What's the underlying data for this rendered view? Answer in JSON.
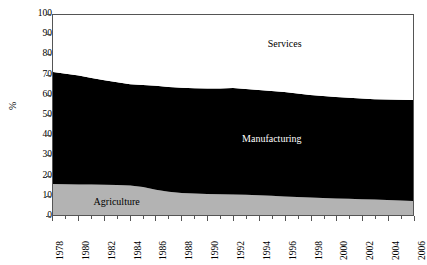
{
  "chart_data": {
    "type": "area",
    "stacked": true,
    "title": "",
    "subtitle": "",
    "xlabel": "",
    "ylabel": "%",
    "xlim": [
      1978,
      2006
    ],
    "ylim": [
      0,
      100
    ],
    "grid": false,
    "legend_position": "inline-labels",
    "y_ticks": [
      0,
      10,
      20,
      30,
      40,
      50,
      60,
      70,
      80,
      90,
      100
    ],
    "x_ticks_major": [
      1978,
      1980,
      1982,
      1984,
      1986,
      1988,
      1990,
      1992,
      1994,
      1996,
      1998,
      2000,
      2002,
      2004,
      2006
    ],
    "x_ticks_minor": [
      1979,
      1981,
      1983,
      1985,
      1987,
      1989,
      1991,
      1993,
      1995,
      1997,
      1999,
      2001,
      2003,
      2005
    ],
    "x": [
      1978,
      1979,
      1980,
      1981,
      1982,
      1983,
      1984,
      1985,
      1986,
      1987,
      1988,
      1989,
      1990,
      1991,
      1992,
      1993,
      1994,
      1995,
      1996,
      1997,
      1998,
      1999,
      2000,
      2001,
      2002,
      2003,
      2004,
      2005,
      2006
    ],
    "series": [
      {
        "name": "Agriculture",
        "color": "#b3b3b3",
        "label_color": "#000000",
        "values": [
          15.5,
          15.4,
          15.3,
          15.2,
          15.1,
          15.0,
          14.8,
          14.0,
          12.6,
          11.6,
          11.0,
          10.7,
          10.5,
          10.4,
          10.3,
          10.1,
          9.9,
          9.6,
          9.3,
          9.0,
          8.7,
          8.5,
          8.3,
          8.1,
          7.9,
          7.7,
          7.5,
          7.2,
          7.0
        ]
      },
      {
        "name": "Manufacturing",
        "color": "#000000",
        "label_color": "#ffffff",
        "values": [
          56.0,
          55.2,
          54.4,
          53.3,
          52.3,
          51.4,
          50.6,
          51.0,
          52.0,
          52.4,
          52.6,
          52.7,
          52.7,
          52.8,
          53.2,
          52.9,
          52.6,
          52.4,
          52.2,
          51.8,
          51.3,
          51.0,
          50.7,
          50.5,
          50.3,
          50.2,
          50.2,
          50.4,
          50.5
        ]
      },
      {
        "name": "Services",
        "color": "#ffffff",
        "label_color": "#000000",
        "values": [
          28.5,
          29.4,
          30.3,
          31.5,
          32.6,
          33.6,
          34.6,
          35.0,
          35.4,
          36.0,
          36.4,
          36.6,
          36.8,
          36.8,
          36.5,
          37.0,
          37.5,
          38.0,
          38.5,
          39.2,
          40.0,
          40.5,
          41.0,
          41.4,
          41.8,
          42.1,
          42.3,
          42.4,
          42.5
        ]
      }
    ],
    "cumulative_top_boundaries": {
      "agriculture_top": [
        15.5,
        15.4,
        15.3,
        15.2,
        15.1,
        15.0,
        14.8,
        14.0,
        12.6,
        11.6,
        11.0,
        10.7,
        10.5,
        10.4,
        10.3,
        10.1,
        9.9,
        9.6,
        9.3,
        9.0,
        8.7,
        8.5,
        8.3,
        8.1,
        7.9,
        7.7,
        7.5,
        7.2,
        7.0
      ],
      "manufacturing_top": [
        71.5,
        70.6,
        69.7,
        68.5,
        67.4,
        66.4,
        65.4,
        65.0,
        64.6,
        64.0,
        63.6,
        63.4,
        63.2,
        63.2,
        63.5,
        63.0,
        62.5,
        62.0,
        61.5,
        60.8,
        60.0,
        59.5,
        59.0,
        58.6,
        58.2,
        57.9,
        57.7,
        57.6,
        57.5
      ]
    },
    "annotations": [
      {
        "text": "Services",
        "x": 1996,
        "y": 85
      },
      {
        "text": "Manufacturing",
        "x": 1995,
        "y": 38
      },
      {
        "text": "Agriculture",
        "x": 1983,
        "y": 7
      }
    ]
  },
  "axis": {
    "y_label": "%",
    "y_tick_labels": [
      "100",
      "90",
      "80",
      "70",
      "60",
      "50",
      "40",
      "30",
      "20",
      "10",
      "0"
    ],
    "x_tick_labels": [
      "1978",
      "1980",
      "1982",
      "1984",
      "1986",
      "1988",
      "1990",
      "1992",
      "1994",
      "1996",
      "1998",
      "2000",
      "2002",
      "2004",
      "2006"
    ]
  },
  "labels": {
    "services": "Services",
    "manufacturing": "Manufacturing",
    "agriculture": "Agriculture"
  }
}
